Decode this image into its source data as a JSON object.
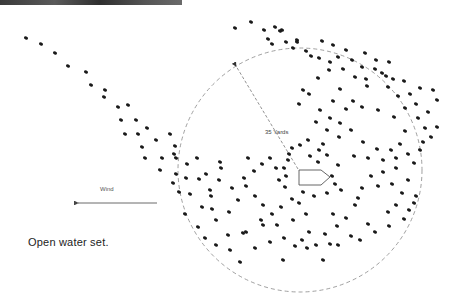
{
  "diagram": {
    "caption": "Open water set.",
    "wind_label": "Wind",
    "radius_label": "35 Yards",
    "colors": {
      "dot": "#1a1a1a",
      "circle": "#888888",
      "boat": "#555555",
      "arrow": "#444444",
      "photo_strip": "#3a3a3a"
    },
    "circle": {
      "cx": 300,
      "cy": 170,
      "r": 122
    },
    "boat": {
      "points": "299,170 321,170 330,177 321,185 299,185"
    },
    "radius_line": {
      "x1": 298,
      "y1": 169,
      "x2": 236,
      "y2": 66
    },
    "wind_arrow": {
      "x1": 157,
      "y1": 203,
      "x2": 78,
      "y2": 203
    },
    "decoys": [
      [
        26,
        38
      ],
      [
        41,
        44
      ],
      [
        55,
        53
      ],
      [
        68,
        66
      ],
      [
        86,
        72
      ],
      [
        91,
        85
      ],
      [
        105,
        90
      ],
      [
        104,
        97
      ],
      [
        118,
        107
      ],
      [
        128,
        105
      ],
      [
        121,
        120
      ],
      [
        136,
        120
      ],
      [
        147,
        128
      ],
      [
        125,
        134
      ],
      [
        138,
        134
      ],
      [
        156,
        140
      ],
      [
        170,
        134
      ],
      [
        142,
        147
      ],
      [
        175,
        146
      ],
      [
        174,
        154
      ],
      [
        145,
        158
      ],
      [
        162,
        158
      ],
      [
        176,
        158
      ],
      [
        160,
        170
      ],
      [
        176,
        174
      ],
      [
        173,
        183
      ],
      [
        179,
        192
      ],
      [
        187,
        164
      ],
      [
        197,
        158
      ],
      [
        186,
        178
      ],
      [
        199,
        179
      ],
      [
        190,
        194
      ],
      [
        206,
        174
      ],
      [
        210,
        190
      ],
      [
        220,
        162
      ],
      [
        221,
        168
      ],
      [
        219,
        180
      ],
      [
        211,
        196
      ],
      [
        202,
        207
      ],
      [
        212,
        209
      ],
      [
        198,
        227
      ],
      [
        185,
        214
      ],
      [
        216,
        220
      ],
      [
        229,
        212
      ],
      [
        243,
        233
      ],
      [
        228,
        235
      ],
      [
        238,
        200
      ],
      [
        246,
        186
      ],
      [
        232,
        188
      ],
      [
        244,
        178
      ],
      [
        254,
        171
      ],
      [
        248,
        158
      ],
      [
        262,
        164
      ],
      [
        270,
        158
      ],
      [
        276,
        168
      ],
      [
        288,
        160
      ],
      [
        284,
        168
      ],
      [
        286,
        176
      ],
      [
        279,
        180
      ],
      [
        285,
        187
      ],
      [
        292,
        148
      ],
      [
        289,
        154
      ],
      [
        300,
        145
      ],
      [
        308,
        140
      ],
      [
        310,
        156
      ],
      [
        318,
        162
      ],
      [
        319,
        150
      ],
      [
        323,
        144
      ],
      [
        327,
        155
      ],
      [
        332,
        176
      ],
      [
        338,
        165
      ],
      [
        335,
        184
      ],
      [
        341,
        190
      ],
      [
        327,
        193
      ],
      [
        314,
        196
      ],
      [
        303,
        192
      ],
      [
        299,
        203
      ],
      [
        292,
        199
      ],
      [
        281,
        207
      ],
      [
        272,
        214
      ],
      [
        263,
        205
      ],
      [
        255,
        196
      ],
      [
        261,
        220
      ],
      [
        277,
        225
      ],
      [
        293,
        220
      ],
      [
        306,
        214
      ],
      [
        309,
        232
      ],
      [
        325,
        234
      ],
      [
        333,
        214
      ],
      [
        337,
        226
      ],
      [
        346,
        218
      ],
      [
        355,
        205
      ],
      [
        358,
        198
      ],
      [
        362,
        188
      ],
      [
        371,
        176
      ],
      [
        383,
        172
      ],
      [
        378,
        186
      ],
      [
        392,
        184
      ],
      [
        396,
        168
      ],
      [
        402,
        193
      ],
      [
        396,
        205
      ],
      [
        388,
        212
      ],
      [
        368,
        224
      ],
      [
        351,
        236
      ],
      [
        338,
        245
      ],
      [
        323,
        260
      ],
      [
        307,
        248
      ],
      [
        295,
        246
      ],
      [
        283,
        260
      ],
      [
        270,
        242
      ],
      [
        255,
        248
      ],
      [
        246,
        232
      ],
      [
        240,
        262
      ],
      [
        230,
        250
      ],
      [
        216,
        245
      ],
      [
        205,
        238
      ],
      [
        263,
        225
      ],
      [
        284,
        238
      ],
      [
        302,
        240
      ],
      [
        316,
        245
      ],
      [
        330,
        244
      ],
      [
        360,
        240
      ],
      [
        375,
        232
      ],
      [
        389,
        226
      ],
      [
        404,
        219
      ],
      [
        409,
        210
      ],
      [
        414,
        203
      ],
      [
        416,
        196
      ],
      [
        408,
        180
      ],
      [
        414,
        163
      ],
      [
        420,
        150
      ],
      [
        423,
        142
      ],
      [
        431,
        137
      ],
      [
        437,
        127
      ],
      [
        425,
        128
      ],
      [
        418,
        118
      ],
      [
        428,
        112
      ],
      [
        416,
        104
      ],
      [
        405,
        108
      ],
      [
        398,
        96
      ],
      [
        410,
        94
      ],
      [
        420,
        88
      ],
      [
        433,
        90
      ],
      [
        437,
        100
      ],
      [
        404,
        81
      ],
      [
        393,
        79
      ],
      [
        388,
        87
      ],
      [
        382,
        73
      ],
      [
        375,
        69
      ],
      [
        366,
        79
      ],
      [
        362,
        67
      ],
      [
        352,
        60
      ],
      [
        338,
        57
      ],
      [
        330,
        62
      ],
      [
        319,
        58
      ],
      [
        311,
        56
      ],
      [
        306,
        51
      ],
      [
        293,
        48
      ],
      [
        297,
        40
      ],
      [
        286,
        42
      ],
      [
        272,
        44
      ],
      [
        268,
        39
      ],
      [
        282,
        30
      ],
      [
        275,
        27
      ],
      [
        264,
        30
      ],
      [
        251,
        22
      ],
      [
        235,
        28
      ],
      [
        280,
        31
      ],
      [
        297,
        42
      ],
      [
        322,
        41
      ],
      [
        333,
        45
      ],
      [
        346,
        50
      ],
      [
        365,
        53
      ],
      [
        376,
        60
      ],
      [
        389,
        62
      ],
      [
        386,
        76
      ],
      [
        367,
        86
      ],
      [
        355,
        77
      ],
      [
        343,
        69
      ],
      [
        329,
        70
      ],
      [
        318,
        78
      ],
      [
        340,
        89
      ],
      [
        353,
        101
      ],
      [
        362,
        107
      ],
      [
        378,
        110
      ],
      [
        394,
        117
      ],
      [
        405,
        131
      ],
      [
        400,
        144
      ],
      [
        391,
        150
      ],
      [
        377,
        149
      ],
      [
        363,
        142
      ],
      [
        351,
        130
      ],
      [
        340,
        123
      ],
      [
        330,
        118
      ],
      [
        320,
        110
      ],
      [
        333,
        101
      ],
      [
        346,
        109
      ],
      [
        309,
        94
      ],
      [
        299,
        104
      ],
      [
        303,
        90
      ],
      [
        316,
        122
      ],
      [
        327,
        130
      ],
      [
        339,
        137
      ],
      [
        354,
        156
      ],
      [
        368,
        158
      ],
      [
        383,
        160
      ],
      [
        396,
        158
      ],
      [
        408,
        154
      ]
    ]
  }
}
